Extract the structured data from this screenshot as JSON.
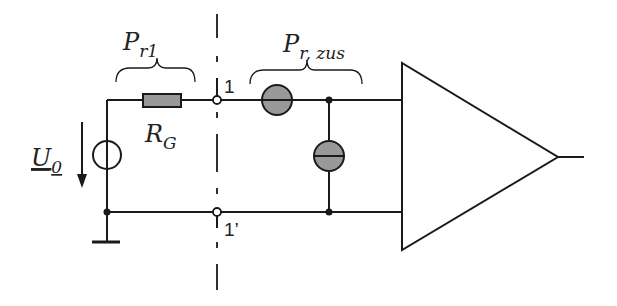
{
  "diagram": {
    "type": "circuit-schematic",
    "colors": {
      "line": "#1a1a1a",
      "component_fill": "#999999",
      "background": "#ffffff"
    },
    "labels": {
      "source_voltage": {
        "main": "U",
        "sub": "0"
      },
      "resistor": {
        "main": "R",
        "sub": "G"
      },
      "power_left": {
        "main": "P",
        "sub": "r1"
      },
      "power_right": {
        "main": "P",
        "sub": "r, zus"
      },
      "terminal_top": "1",
      "terminal_bottom": "1’"
    },
    "components": [
      {
        "id": "voltage-source",
        "kind": "source"
      },
      {
        "id": "source-resistor",
        "kind": "resistor",
        "label": "R_G"
      },
      {
        "id": "series-noise-source",
        "kind": "noise-source-series"
      },
      {
        "id": "shunt-noise-source",
        "kind": "noise-source-shunt"
      },
      {
        "id": "amplifier",
        "kind": "amplifier"
      },
      {
        "id": "ground",
        "kind": "ground"
      }
    ]
  }
}
